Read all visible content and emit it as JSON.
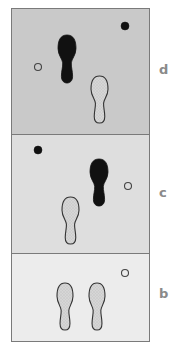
{
  "figure": {
    "panels": [
      {
        "id": "d",
        "label": "d",
        "background": "#c9c9c9",
        "rect": [
          11,
          8,
          138,
          126
        ],
        "label_pos": [
          159,
          63
        ],
        "footprints": [
          {
            "style": "filled",
            "cx": 67,
            "top": 35,
            "bottom": 83,
            "w": 18
          },
          {
            "style": "dotted",
            "cx": 99.5,
            "top": 76,
            "bottom": 123,
            "w": 17
          }
        ],
        "markers": [
          {
            "type": "open",
            "cx": 38,
            "cy": 67,
            "r": 3.5
          },
          {
            "type": "filled",
            "cx": 125,
            "cy": 26,
            "r": 4
          }
        ]
      },
      {
        "id": "c",
        "label": "c",
        "background": "#dedede",
        "rect": [
          11,
          134,
          138,
          119
        ],
        "label_pos": [
          159,
          186
        ],
        "footprints": [
          {
            "style": "filled",
            "cx": 99,
            "top": 159,
            "bottom": 206,
            "w": 18
          },
          {
            "style": "dotted",
            "cx": 70.5,
            "top": 197,
            "bottom": 244,
            "w": 17
          }
        ],
        "markers": [
          {
            "type": "filled",
            "cx": 38,
            "cy": 150,
            "r": 4
          },
          {
            "type": "open",
            "cx": 128,
            "cy": 186,
            "r": 3.5
          }
        ]
      },
      {
        "id": "b",
        "label": "b",
        "background": "#ececec",
        "rect": [
          11,
          253,
          138,
          88
        ],
        "label_pos": [
          159,
          287
        ],
        "footprints": [
          {
            "style": "dotted",
            "cx": 65,
            "top": 283,
            "bottom": 330,
            "w": 16
          },
          {
            "style": "dotted",
            "cx": 97,
            "top": 283,
            "bottom": 330,
            "w": 16
          }
        ],
        "markers": [
          {
            "type": "open",
            "cx": 125,
            "cy": 273,
            "r": 3.5
          }
        ]
      }
    ],
    "colors": {
      "frame": "#7a7a7a",
      "filled": "#111111",
      "dotted_fill": "#d4d4d4",
      "outline": "#333333",
      "label": "#8a8a8a"
    }
  }
}
